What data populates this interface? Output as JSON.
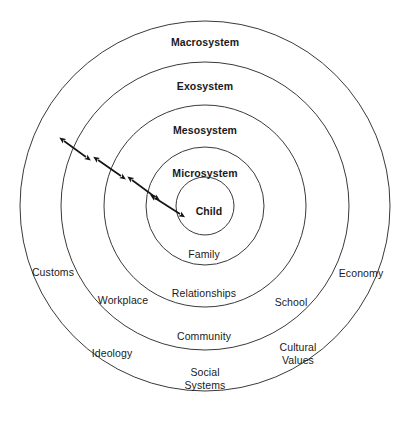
{
  "diagram": {
    "type": "concentric-circles",
    "background_color": "#ffffff",
    "stroke_color": "#3a3a3a",
    "text_color": "#1a1a1a",
    "center": {
      "x": 205,
      "y": 206
    },
    "rings": [
      {
        "name": "Macrosystem",
        "radius": 185,
        "label_x": 205,
        "label_y": 43,
        "examples": [
          {
            "text": "Customs",
            "x": 53,
            "y": 273
          },
          {
            "text": "Economy",
            "x": 361,
            "y": 274
          },
          {
            "text": "Ideology",
            "x": 112,
            "y": 354
          },
          {
            "text": "Cultural\nValues",
            "x": 298,
            "y": 354
          }
        ]
      },
      {
        "name": "Exosystem",
        "radius": 144,
        "label_x": 205,
        "label_y": 87,
        "examples": [
          {
            "text": "Workplace",
            "x": 123,
            "y": 301
          },
          {
            "text": "School",
            "x": 291,
            "y": 303
          },
          {
            "text": "Social\nSystems",
            "x": 205,
            "y": 379
          }
        ]
      },
      {
        "name": "Mesosystem",
        "radius": 101,
        "label_x": 205,
        "label_y": 131,
        "examples": [
          {
            "text": "Community",
            "x": 204,
            "y": 337
          }
        ]
      },
      {
        "name": "Microsystem",
        "radius": 59,
        "label_x": 205,
        "label_y": 174,
        "examples": [
          {
            "text": "Relationships",
            "x": 204,
            "y": 294
          }
        ]
      },
      {
        "name": "Child",
        "radius": 29,
        "label_x": 209,
        "label_y": 212,
        "examples": [
          {
            "text": "Family",
            "x": 204,
            "y": 255
          }
        ]
      }
    ],
    "arrows": [
      {
        "name": "macrosystem-exosystem-arrow",
        "x1": 64,
        "y1": 141,
        "x2": 86,
        "y2": 157
      },
      {
        "name": "exosystem-mesosystem-arrow",
        "x1": 98,
        "y1": 160,
        "x2": 121,
        "y2": 176
      },
      {
        "name": "mesosystem-microsystem-arrow",
        "x1": 132,
        "y1": 180,
        "x2": 155,
        "y2": 197
      },
      {
        "name": "microsystem-child-arrow",
        "x1": 155,
        "y1": 198,
        "x2": 180,
        "y2": 214
      }
    ]
  }
}
